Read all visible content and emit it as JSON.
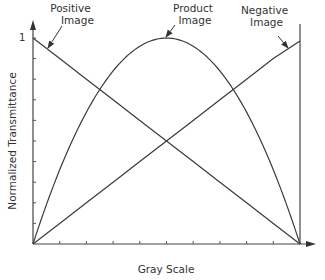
{
  "chart_data": {
    "type": "line",
    "title": "",
    "xlabel": "Gray Scale",
    "ylabel": "Normalized Transmittance",
    "xlim": [
      0,
      1
    ],
    "ylim": [
      0,
      1
    ],
    "y_tick_labels": [
      "1"
    ],
    "x_tick_count": 10,
    "y_tick_count": 10,
    "grid": false,
    "legend": "inline annotations with arrows",
    "x": [
      0,
      0.1,
      0.2,
      0.3,
      0.4,
      0.5,
      0.6,
      0.7,
      0.8,
      0.9,
      1.0
    ],
    "series": [
      {
        "name": "Positive Image",
        "values": [
          1.0,
          0.9,
          0.8,
          0.7,
          0.6,
          0.5,
          0.4,
          0.3,
          0.2,
          0.1,
          0.0
        ]
      },
      {
        "name": "Negative Image",
        "values": [
          0.0,
          0.1,
          0.2,
          0.3,
          0.4,
          0.5,
          0.6,
          0.7,
          0.8,
          0.9,
          0.985
        ]
      },
      {
        "name": "Product Image",
        "values": [
          0.0,
          0.36,
          0.64,
          0.84,
          0.96,
          1.0,
          0.96,
          0.84,
          0.64,
          0.36,
          0.0
        ]
      }
    ],
    "annotations": [
      {
        "text": "Positive Image",
        "points_to": "Positive Image",
        "at_x": 0.04
      },
      {
        "text": "Product Image",
        "points_to": "Product Image",
        "at_x": 0.5
      },
      {
        "text": "Negative Image",
        "points_to": "Negative Image",
        "at_x": 0.95
      }
    ]
  },
  "labels": {
    "positive_line1": "Positive",
    "positive_line2": "Image",
    "product_line1": "Product",
    "product_line2": "Image",
    "negative_line1": "Negative",
    "negative_line2": "Image",
    "y_axis": "Normalized Transmittance",
    "x_axis": "Gray Scale",
    "y_top_tick": "1"
  },
  "colors": {
    "line": "#3a3a3a",
    "background": "#ffffff"
  }
}
